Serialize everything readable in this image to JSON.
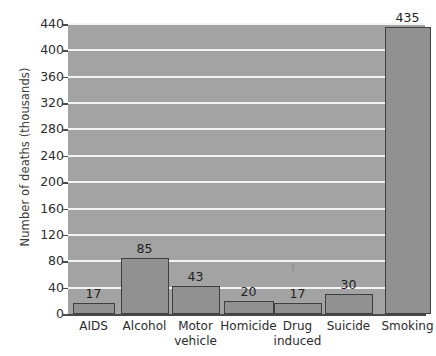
{
  "chart_data": {
    "type": "bar",
    "title": "",
    "xlabel": "",
    "ylabel": "Number of deaths (thousands)",
    "categories": [
      "AIDS",
      "Alcohol",
      "Motor vehicle",
      "Homicide",
      "Drug induced",
      "Suicide",
      "Smoking"
    ],
    "values": [
      17,
      85,
      43,
      20,
      17,
      30,
      435
    ],
    "value_labels": [
      "17",
      "85",
      "43",
      "20",
      "17",
      "30",
      "435"
    ],
    "ylim": [
      0,
      440
    ],
    "yticks": [
      0,
      40,
      80,
      120,
      160,
      200,
      240,
      280,
      320,
      360,
      400,
      440
    ],
    "ytick_labels": [
      "0",
      "40",
      "80",
      "120",
      "160",
      "200",
      "240",
      "280",
      "320",
      "360",
      "400",
      "440"
    ],
    "grid": "horizontal",
    "legend": "none",
    "colors": {
      "plot_background": "#a3a3a3",
      "gridline": "#f4f4f4",
      "bar_fill": "#919191",
      "bar_border": "#3f3f3f",
      "axis": "#4a4a4a",
      "text": "#2b2b2b",
      "page_background": "#ffffff"
    }
  }
}
